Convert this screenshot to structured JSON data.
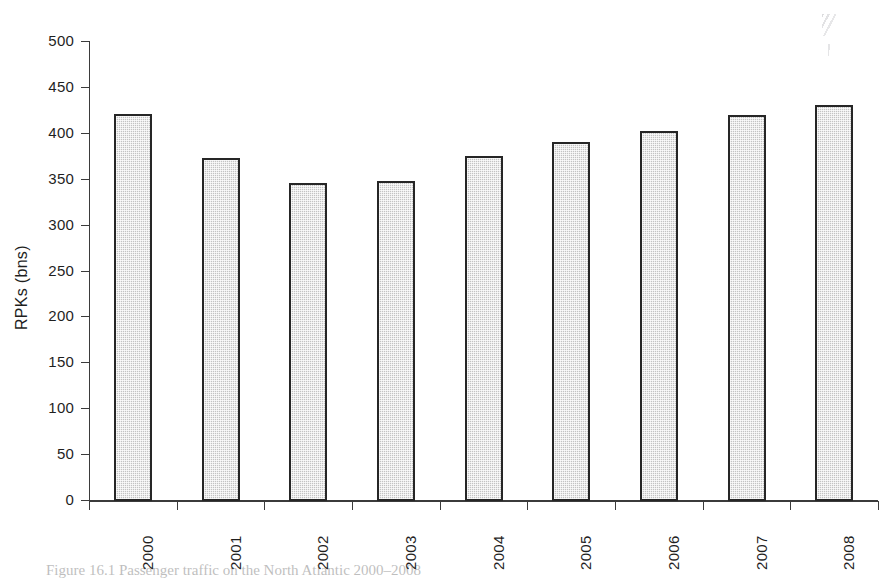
{
  "figure": {
    "caption_prefix": "Figure 16.1",
    "caption_text": "Passenger traffic on the North Atlantic 2000–2008",
    "y_axis_title": "RPKs (bns)"
  },
  "chart_data": {
    "type": "bar",
    "title": "",
    "xlabel": "",
    "ylabel": "RPKs (bns)",
    "categories": [
      "2000",
      "2001",
      "2002",
      "2003",
      "2004",
      "2005",
      "2006",
      "2007",
      "2008"
    ],
    "values": [
      420,
      373,
      345,
      348,
      375,
      390,
      402,
      419,
      430
    ],
    "ylim": [
      0,
      500
    ],
    "ytick_values": [
      0,
      50,
      100,
      150,
      200,
      250,
      300,
      350,
      400,
      450,
      500
    ],
    "ytick_labels": [
      "0",
      "50",
      "100",
      "150",
      "200",
      "250",
      "300",
      "350",
      "400",
      "450",
      "500"
    ],
    "grid": false,
    "legend": false,
    "legend_position": "none",
    "bar_fill_color": "#c3c3c3",
    "bar_edge_color": "#262626",
    "axis_color": "#3b3b3b",
    "background_color": "#ffffff"
  }
}
